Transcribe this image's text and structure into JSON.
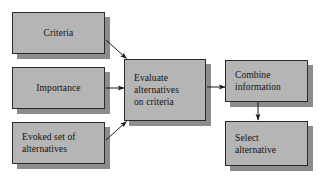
{
  "diagram": {
    "background_color": "#ffffff",
    "node_fill_color": "#b5b5b5",
    "node_border_color": "#2a2a2a",
    "shadow_color": "#8c8c8c",
    "text_color": "#111111",
    "nodes": [
      {
        "id": "criteria",
        "label": "Criteria"
      },
      {
        "id": "importance",
        "label": "Importance"
      },
      {
        "id": "evoked_set",
        "label": "Evoked set of\nalternatives"
      },
      {
        "id": "evaluate",
        "label": "Evaluate\nalternatives\non criteria"
      },
      {
        "id": "combine",
        "label": "Combine\ninformation"
      },
      {
        "id": "select",
        "label": "Select\nalternative"
      }
    ],
    "edges": [
      {
        "id": "criteria-to-evaluate",
        "from": "criteria",
        "to": "evaluate",
        "style": "diagonal-down-right"
      },
      {
        "id": "importance-to-evaluate",
        "from": "importance",
        "to": "evaluate",
        "style": "horizontal"
      },
      {
        "id": "evoked-to-evaluate",
        "from": "evoked_set",
        "to": "evaluate",
        "style": "diagonal-up-right"
      },
      {
        "id": "evaluate-to-combine",
        "from": "evaluate",
        "to": "combine",
        "style": "horizontal"
      },
      {
        "id": "combine-to-select",
        "from": "combine",
        "to": "select",
        "style": "vertical-down"
      }
    ]
  }
}
